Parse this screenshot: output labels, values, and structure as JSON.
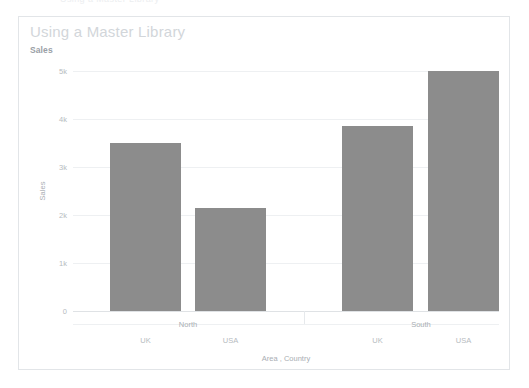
{
  "top_strip": {
    "ghost_text": "Using a Master Library"
  },
  "card": {
    "title": "Using a Master Library",
    "measure_label": "Sales"
  },
  "chart_data": {
    "type": "bar",
    "title": "Sales",
    "xlabel": "Area , Country",
    "ylabel": "Sales",
    "ylim": [
      0,
      5000
    ],
    "grid": true,
    "legend": "none",
    "bar_color": "#8c8c8c",
    "ytick_labels": [
      "0",
      "1k",
      "2k",
      "3k",
      "4k",
      "5k"
    ],
    "ytick_values": [
      0,
      1000,
      2000,
      3000,
      4000,
      5000
    ],
    "groups": [
      {
        "name": "North",
        "categories": [
          "UK",
          "USA"
        ],
        "values": [
          3500,
          2150
        ]
      },
      {
        "name": "South",
        "categories": [
          "UK",
          "USA"
        ],
        "values": [
          3850,
          5000
        ]
      }
    ],
    "categories": [
      "North / UK",
      "North / USA",
      "South / UK",
      "South / USA"
    ],
    "values": [
      3500,
      2150,
      3850,
      5000
    ]
  }
}
